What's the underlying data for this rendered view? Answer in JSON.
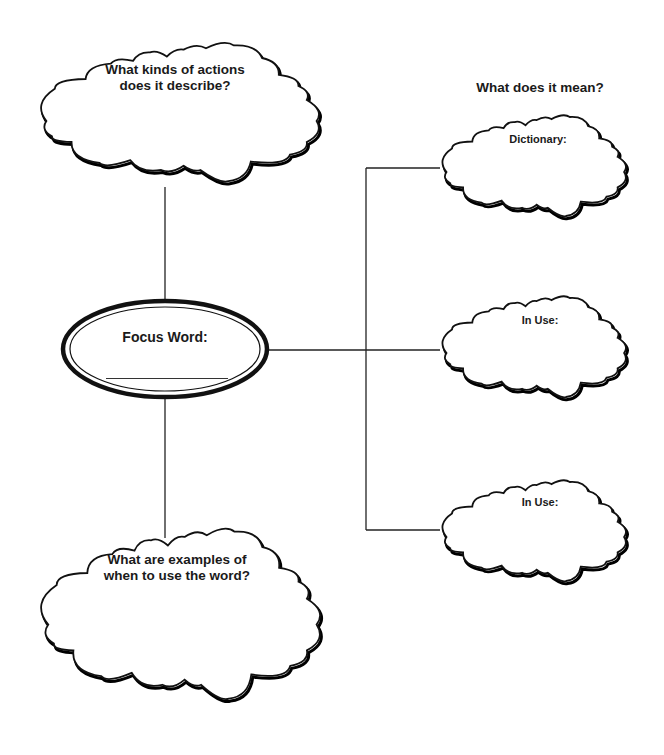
{
  "diagram": {
    "type": "vocabulary-concept-map",
    "colors": {
      "ink": "#111111",
      "paper": "#ffffff"
    },
    "focus": {
      "label": "Focus Word:",
      "answer": ""
    },
    "clouds": {
      "actions": {
        "line1": "What kinds of actions",
        "line2": "does it describe?"
      },
      "examples": {
        "line1": "What are examples of",
        "line2": "when to use the word?"
      },
      "dictionary": {
        "label": "Dictionary:"
      },
      "in_use_1": {
        "label": "In Use:"
      },
      "in_use_2": {
        "label": "In Use:"
      }
    },
    "meaning_heading": "What does it mean?"
  }
}
